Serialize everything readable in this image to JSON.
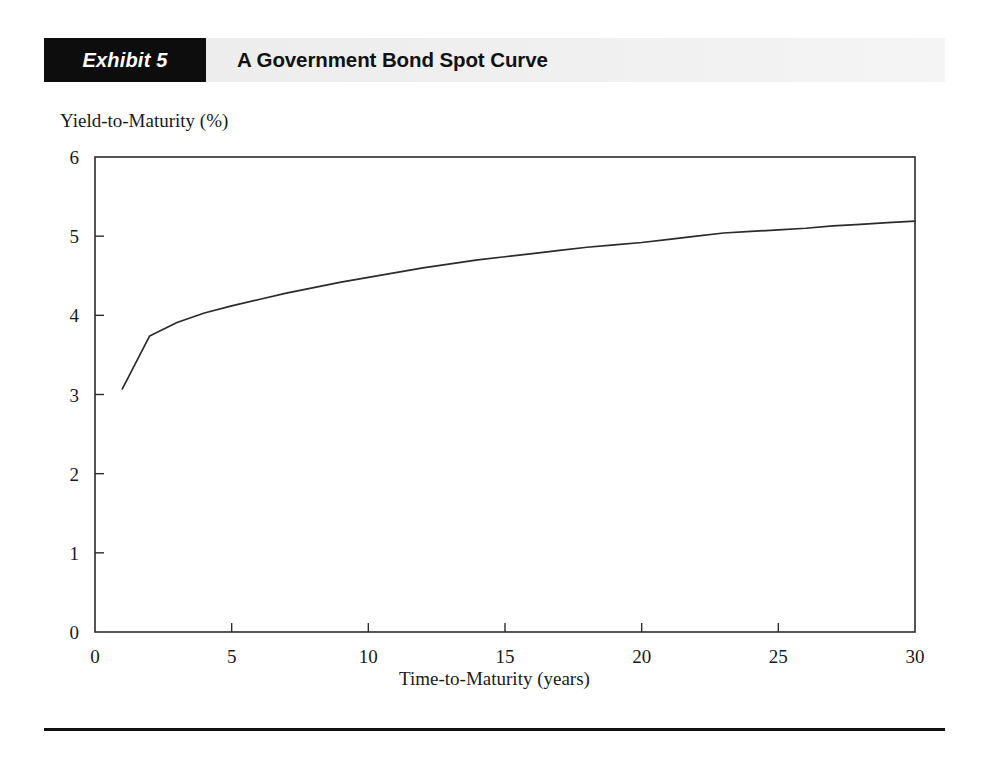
{
  "exhibit": {
    "tag_label": "Exhibit 5",
    "title": "A Government Bond Spot Curve"
  },
  "chart_data": {
    "type": "line",
    "title": "A Government Bond Spot Curve",
    "xlabel": "Time-to-Maturity (years)",
    "ylabel": "Yield-to-Maturity (%)",
    "xlim": [
      0,
      30
    ],
    "ylim": [
      0,
      6
    ],
    "xticks": [
      0,
      5,
      10,
      15,
      20,
      25,
      30
    ],
    "yticks": [
      0,
      1,
      2,
      3,
      4,
      5,
      6
    ],
    "xticklabels": [
      "0",
      "5",
      "10",
      "15",
      "20",
      "25",
      "30"
    ],
    "yticklabels": [
      "0",
      "1",
      "2",
      "3",
      "4",
      "5",
      "6"
    ],
    "grid": false,
    "legend": null,
    "line_color": "#2b2b2b",
    "series": [
      {
        "name": "Government bond spot curve",
        "x": [
          1,
          2,
          3,
          4,
          5,
          6,
          7,
          8,
          9,
          10,
          11,
          12,
          13,
          14,
          15,
          16,
          17,
          18,
          19,
          20,
          21,
          22,
          23,
          24,
          25,
          26,
          27,
          28,
          29,
          30
        ],
        "values": [
          3.07,
          3.74,
          3.91,
          4.03,
          4.12,
          4.2,
          4.28,
          4.35,
          4.42,
          4.48,
          4.54,
          4.6,
          4.65,
          4.7,
          4.74,
          4.78,
          4.82,
          4.86,
          4.89,
          4.92,
          4.96,
          5.0,
          5.04,
          5.06,
          5.08,
          5.1,
          5.13,
          5.15,
          5.17,
          5.19
        ]
      }
    ]
  }
}
